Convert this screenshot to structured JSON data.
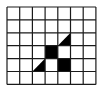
{
  "grid": {
    "cols": 7,
    "rows": 6,
    "origin_x": 7,
    "origin_y": 7,
    "cell_w": 12.7,
    "cell_h": 12.9,
    "line_color": "#1a1a1a",
    "fill_color": "#000000",
    "background": "#ffffff"
  },
  "shaded_cells": [
    {
      "row": 2,
      "col": 4,
      "shape": "triangle-lower-right"
    },
    {
      "row": 3,
      "col": 3,
      "shape": "full"
    },
    {
      "row": 4,
      "col": 2,
      "shape": "triangle-lower-right"
    },
    {
      "row": 4,
      "col": 4,
      "shape": "full"
    }
  ]
}
